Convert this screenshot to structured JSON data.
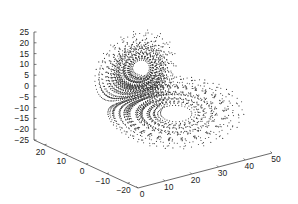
{
  "chart_data": {
    "type": "scatter",
    "subtype": "3d-scatter",
    "title": "",
    "axes": {
      "x": {
        "label": "",
        "ticks": [
          0,
          10,
          20,
          30,
          40,
          50
        ],
        "range": [
          0,
          50
        ]
      },
      "y": {
        "label": "",
        "ticks": [
          20,
          10,
          0,
          -10,
          -20
        ],
        "range": [
          -25,
          25
        ]
      },
      "z": {
        "label": "",
        "ticks": [
          25,
          20,
          15,
          10,
          5,
          0,
          -5,
          -10,
          -15,
          -20,
          -25
        ],
        "range": [
          -25,
          25
        ]
      }
    },
    "grid": false,
    "legend": null,
    "lobes": [
      {
        "name": "upper-lobe",
        "center": [
          27,
          8.5,
          8.5
        ]
      },
      {
        "name": "lower-lobe",
        "center": [
          27,
          -8.5,
          -8.5
        ]
      }
    ],
    "system": {
      "sigma": 10,
      "rho": 28,
      "beta": 2.6667
    },
    "marker_color": "#333333"
  },
  "labels": {
    "x_ticks": [
      "0",
      "10",
      "20",
      "30",
      "40",
      "50"
    ],
    "y_ticks": [
      "20",
      "10",
      "0",
      "−10",
      "−20"
    ],
    "z_ticks": [
      "25",
      "20",
      "15",
      "10",
      "5",
      "0",
      "−5",
      "−10",
      "−15",
      "−20",
      "−25"
    ]
  }
}
